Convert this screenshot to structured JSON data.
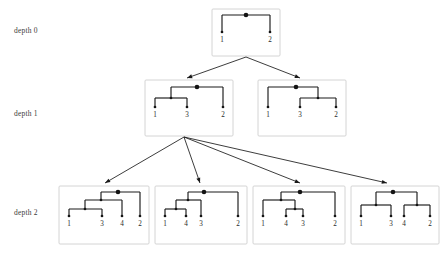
{
  "figure": {
    "type": "tree-enumeration-diagram",
    "background": "#ffffff",
    "line_color": "#1a1a1a",
    "box_border_color": "#c9c9c9",
    "label_color": "#3a3a3a"
  },
  "levels": [
    {
      "id": "depth0",
      "label": "depth 0",
      "label_x": 14,
      "label_y": 30,
      "trees": [
        {
          "id": "d0-t1",
          "box": {
            "x": 212,
            "y": 9,
            "w": 68,
            "h": 47
          },
          "root": {
            "x": 246,
            "y": 15
          },
          "leaves": [
            {
              "label": "1",
              "x": 222,
              "y": 38
            },
            {
              "label": "2",
              "x": 270,
              "y": 38
            }
          ],
          "internal": [],
          "newick": "(1,2)"
        }
      ]
    },
    {
      "id": "depth1",
      "label": "depth 1",
      "label_x": 14,
      "label_y": 113,
      "trees": [
        {
          "id": "d1-t1",
          "box": {
            "x": 145,
            "y": 80,
            "w": 88,
            "h": 56
          },
          "root": {
            "x": 197,
            "y": 87
          },
          "leaves": [
            {
              "label": "1",
              "x": 155,
              "y": 113
            },
            {
              "label": "3",
              "x": 187,
              "y": 113
            },
            {
              "label": "2",
              "x": 223,
              "y": 113
            }
          ],
          "internal": [
            {
              "x": 171,
              "y": 98
            }
          ],
          "newick": "((1,3),2)"
        },
        {
          "id": "d1-t2",
          "box": {
            "x": 258,
            "y": 80,
            "w": 88,
            "h": 56
          },
          "root": {
            "x": 296,
            "y": 87
          },
          "leaves": [
            {
              "label": "1",
              "x": 268,
              "y": 113
            },
            {
              "label": "3",
              "x": 300,
              "y": 113
            },
            {
              "label": "2",
              "x": 336,
              "y": 113
            }
          ],
          "internal": [
            {
              "x": 318,
              "y": 98
            }
          ],
          "newick": "(1,(3,2))"
        }
      ]
    },
    {
      "id": "depth2",
      "label": "depth 2",
      "label_x": 14,
      "label_y": 212,
      "trees": [
        {
          "id": "d2-t1",
          "box": {
            "x": 59,
            "y": 186,
            "w": 90,
            "h": 58
          },
          "root": {
            "x": 118,
            "y": 192
          },
          "leaves": [
            {
              "label": "1",
              "x": 69,
              "y": 222
            },
            {
              "label": "3",
              "x": 102,
              "y": 222
            },
            {
              "label": "4",
              "x": 122,
              "y": 222
            },
            {
              "label": "2",
              "x": 140,
              "y": 222
            }
          ],
          "internal": [
            {
              "x": 101,
              "y": 200
            },
            {
              "x": 85,
              "y": 209
            }
          ],
          "newick": "(((1,3),4),2)"
        },
        {
          "id": "d2-t2",
          "box": {
            "x": 155,
            "y": 186,
            "w": 92,
            "h": 58
          },
          "root": {
            "x": 204,
            "y": 192
          },
          "leaves": [
            {
              "label": "1",
              "x": 165,
              "y": 222
            },
            {
              "label": "4",
              "x": 186,
              "y": 222
            },
            {
              "label": "3",
              "x": 201,
              "y": 222
            },
            {
              "label": "2",
              "x": 238,
              "y": 222
            }
          ],
          "internal": [
            {
              "x": 188,
              "y": 200
            },
            {
              "x": 176,
              "y": 209
            }
          ],
          "newick": "(((1,4),3),2)"
        },
        {
          "id": "d2-t3",
          "box": {
            "x": 253,
            "y": 186,
            "w": 92,
            "h": 58
          },
          "root": {
            "x": 300,
            "y": 192
          },
          "leaves": [
            {
              "label": "1",
              "x": 263,
              "y": 222
            },
            {
              "label": "4",
              "x": 286,
              "y": 222
            },
            {
              "label": "3",
              "x": 303,
              "y": 222
            },
            {
              "label": "2",
              "x": 335,
              "y": 222
            }
          ],
          "internal": [
            {
              "x": 281,
              "y": 200
            },
            {
              "x": 295,
              "y": 209
            }
          ],
          "newick": "((1,(4,3)),2)"
        },
        {
          "id": "d2-t4",
          "box": {
            "x": 351,
            "y": 186,
            "w": 88,
            "h": 58
          },
          "root": {
            "x": 393,
            "y": 192
          },
          "leaves": [
            {
              "label": "1",
              "x": 361,
              "y": 222
            },
            {
              "label": "3",
              "x": 391,
              "y": 222
            },
            {
              "label": "4",
              "x": 404,
              "y": 222
            },
            {
              "label": "2",
              "x": 430,
              "y": 222
            }
          ],
          "internal": [
            {
              "x": 376,
              "y": 205
            },
            {
              "x": 417,
              "y": 205
            }
          ],
          "newick": "((1,3),(4,2))"
        }
      ]
    }
  ],
  "expansions": [
    {
      "id": "exp-d0",
      "from": {
        "x": 246,
        "y": 57
      },
      "to": [
        {
          "x": 187,
          "y": 78
        },
        {
          "x": 300,
          "y": 78
        }
      ]
    },
    {
      "id": "exp-d1",
      "from": {
        "x": 184,
        "y": 137
      },
      "to": [
        {
          "x": 105,
          "y": 183
        },
        {
          "x": 200,
          "y": 183
        },
        {
          "x": 300,
          "y": 183
        },
        {
          "x": 387,
          "y": 183
        }
      ]
    }
  ]
}
